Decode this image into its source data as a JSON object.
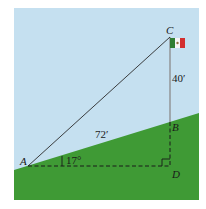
{
  "diagram": {
    "type": "right-triangle-word-problem",
    "colors": {
      "sky": "#c5e0f0",
      "ground": "#3f9a35",
      "line": "#2a2a2a",
      "pole": "#8a8a8a"
    },
    "points": {
      "A": {
        "label": "A"
      },
      "B": {
        "label": "B"
      },
      "C": {
        "label": "C"
      },
      "D": {
        "label": "D"
      }
    },
    "measurements": {
      "AB_length": "72′",
      "BC_length": "40′",
      "angle_A": "17°"
    },
    "objects": {
      "flag": "flag-icon",
      "right_angle": "right-angle-marker"
    }
  }
}
